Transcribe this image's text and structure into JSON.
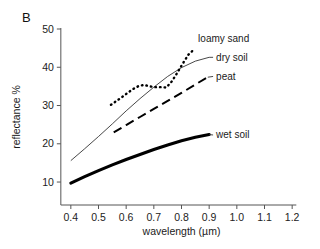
{
  "panel": {
    "label": "B"
  },
  "chart_data": {
    "type": "line",
    "title": "",
    "xlabel": "wavelength (µm)",
    "ylabel": "reflectance %",
    "xlim": [
      0.35,
      1.25
    ],
    "ylim": [
      4,
      50
    ],
    "grid": false,
    "legend_position": "inline-right-of-curves",
    "xticks": [
      "0.4",
      "0.5",
      "0.6",
      "0.7",
      "0.8",
      "0.9",
      "1.0",
      "1.1",
      "1.2"
    ],
    "xtick_values": [
      0.4,
      0.5,
      0.6,
      0.7,
      0.8,
      0.9,
      1.0,
      1.1,
      1.2
    ],
    "yticks": [
      "10",
      "20",
      "30",
      "40",
      "50"
    ],
    "ytick_values": [
      10,
      20,
      30,
      40,
      50
    ],
    "series": [
      {
        "name": "loamy sand",
        "style": "dotted",
        "color": "#000000",
        "label_x": 0.86,
        "label_y": 47.5,
        "x": [
          0.545,
          0.565,
          0.585,
          0.605,
          0.625,
          0.645,
          0.665,
          0.685,
          0.705,
          0.725,
          0.745,
          0.765,
          0.785,
          0.805,
          0.825,
          0.84
        ],
        "y": [
          30.2,
          31.2,
          32.2,
          33.3,
          34.3,
          35.1,
          35.4,
          35.0,
          34.8,
          34.8,
          34.7,
          36.3,
          38.6,
          41.0,
          43.3,
          44.3
        ]
      },
      {
        "name": "dry soil",
        "style": "thin-solid",
        "color": "#333333",
        "label_x": 0.925,
        "label_y": 42.6,
        "x": [
          0.4,
          0.45,
          0.5,
          0.55,
          0.6,
          0.65,
          0.7,
          0.75,
          0.8,
          0.85,
          0.9
        ],
        "y": [
          15.6,
          18.7,
          21.9,
          25.2,
          28.6,
          31.8,
          34.8,
          37.6,
          39.9,
          41.6,
          42.6
        ]
      },
      {
        "name": "peat",
        "style": "dashed",
        "color": "#000000",
        "label_x": 0.925,
        "label_y": 37.6,
        "x": [
          0.555,
          0.6,
          0.65,
          0.7,
          0.75,
          0.8,
          0.85,
          0.895
        ],
        "y": [
          23.0,
          24.9,
          27.0,
          29.1,
          31.2,
          33.3,
          35.5,
          37.4
        ]
      },
      {
        "name": "wet soil",
        "style": "thick-solid",
        "color": "#000000",
        "label_x": 0.925,
        "label_y": 22.3,
        "x": [
          0.4,
          0.45,
          0.5,
          0.55,
          0.6,
          0.65,
          0.7,
          0.75,
          0.8,
          0.85,
          0.9
        ],
        "y": [
          9.7,
          11.4,
          13.0,
          14.5,
          15.9,
          17.2,
          18.5,
          19.7,
          20.8,
          21.7,
          22.4
        ]
      }
    ]
  }
}
